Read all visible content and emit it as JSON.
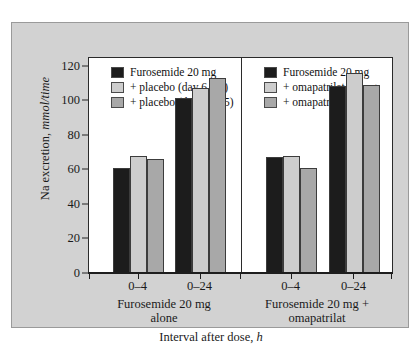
{
  "figure": {
    "background_color": "#d2d2d2",
    "plot_background_color": "#ffffff",
    "frame_color": "#9a9a9a"
  },
  "series_colors": {
    "series_1": "#1c1c1c",
    "series_2": "#cdcdcd",
    "series_3": "#a8a8a8"
  },
  "chart_data": {
    "type": "bar",
    "title": "",
    "xlabel_parts": {
      "text": "Interval after dose,",
      "units": "h"
    },
    "ylabel_parts": {
      "text": "Na excretion,",
      "units": "mmol/time"
    },
    "xlabel": "Interval after dose, h",
    "ylabel": "Na excretion, mmol/time",
    "ylim": [
      0,
      125
    ],
    "yticks": [
      0,
      20,
      40,
      60,
      80,
      100,
      120
    ],
    "ytick_labels": [
      "0",
      "20",
      "40",
      "60",
      "80",
      "100",
      "120"
    ],
    "grid": false,
    "legend_position": "upper-left-and-upper-center",
    "categories": [
      "0–4",
      "0–24",
      "0–4",
      "0–24"
    ],
    "panels": [
      {
        "caption_line1": "Furosemide 20 mg",
        "caption_line2": "alone",
        "categories": [
          "0–4",
          "0–24"
        ],
        "legend": [
          {
            "label": "Furosemide 20 mg",
            "color": "#1c1c1c"
          },
          {
            "label": "+ placebo (day 6–10)",
            "color": "#cdcdcd"
          },
          {
            "label": "+ placebo (day 11–15)",
            "color": "#a8a8a8"
          }
        ],
        "series": [
          {
            "name": "Furosemide 20 mg",
            "values": [
              61,
              101
            ]
          },
          {
            "name": "+ placebo (day 6–10)",
            "values": [
              68,
              107
            ]
          },
          {
            "name": "+ placebo (day 11–15)",
            "values": [
              66,
              113
            ]
          }
        ]
      },
      {
        "caption_line1": "Furosemide 20 mg +",
        "caption_line2": "omapatrilat",
        "categories": [
          "0–4",
          "0–24"
        ],
        "legend": [
          {
            "label": "Furosemide 20 mg",
            "color": "#1c1c1c"
          },
          {
            "label": "+ omapatrilat 10 mg",
            "color": "#cdcdcd"
          },
          {
            "label": "+ omapatrilat 25 mg",
            "color": "#a8a8a8"
          }
        ],
        "series": [
          {
            "name": "Furosemide 20 mg",
            "values": [
              67,
              108
            ]
          },
          {
            "name": "+ omapatrilat 10 mg",
            "values": [
              68,
              116
            ]
          },
          {
            "name": "+ omapatrilat 25 mg",
            "values": [
              61,
              109
            ]
          }
        ]
      }
    ],
    "groups": [
      {
        "category": "0–4",
        "panel": 0,
        "values": [
          61,
          68,
          66
        ]
      },
      {
        "category": "0–24",
        "panel": 0,
        "values": [
          101,
          107,
          113
        ]
      },
      {
        "category": "0–4",
        "panel": 1,
        "values": [
          67,
          68,
          61
        ]
      },
      {
        "category": "0–24",
        "panel": 1,
        "values": [
          108,
          116,
          109
        ]
      }
    ]
  }
}
